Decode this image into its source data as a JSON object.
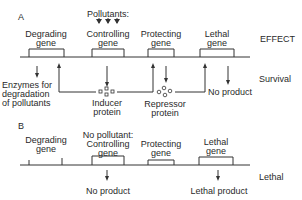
{
  "panel_a": {
    "label": "A",
    "pollutants_label": "Pollutants:",
    "genes": [
      {
        "line1": "Degrading",
        "line2": "gene"
      },
      {
        "line1": "Controlling",
        "line2": "gene"
      },
      {
        "line1": "Protecting",
        "line2": "gene"
      },
      {
        "line1": "Lethal",
        "line2": "gene"
      }
    ],
    "products": {
      "enzymes_line1": "Enzymes for",
      "enzymes_line2": "degradation",
      "enzymes_line3": "of pollutants",
      "inducer_line1": "Inducer",
      "inducer_line2": "protein",
      "repressor_line1": "Repressor",
      "repressor_line2": "protein",
      "no_product": "No product"
    },
    "effect_header": "EFFECT",
    "effect": "Survival"
  },
  "panel_b": {
    "label": "B",
    "no_pollutant_label": "No pollutant:",
    "genes": [
      {
        "line1": "Degrading",
        "line2": "gene"
      },
      {
        "line1": "Controlling",
        "line2": "gene"
      },
      {
        "line1": "Protecting",
        "line2": "gene"
      },
      {
        "line1": "Lethal",
        "line2": "gene"
      }
    ],
    "products": {
      "controlling_product": "No product",
      "lethal_product": "Lethal product"
    },
    "effect": "Lethal"
  }
}
